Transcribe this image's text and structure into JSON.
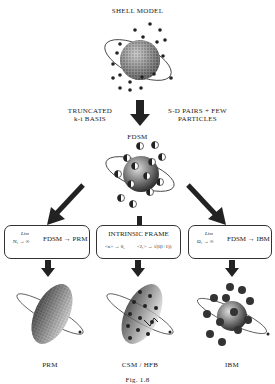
{
  "diagram": {
    "top": {
      "title": "SHELL MODEL"
    },
    "transition": {
      "left_label_line1": "TRUNCATED",
      "left_label_line2": "k-i BASIS",
      "right_label_line1": "S-D PAIRS + FEW",
      "right_label_line2": "PARTICLES"
    },
    "middle": {
      "title": "FDSM"
    },
    "boxes": [
      {
        "lim": "Lim",
        "condition": "N₁ → ∞",
        "result": "FDSM → PRM"
      },
      {
        "title": "INTRINSIC FRAME",
        "formula_left": "<n> → 0,",
        "formula_right": "<J₁> → √(l(l+1))"
      },
      {
        "lim": "Lim",
        "condition": "Ω₁ → ∞",
        "result": "FDSM → IBM"
      }
    ],
    "bottom": [
      {
        "label": "PRM"
      },
      {
        "label": "CSM / HFB"
      },
      {
        "label": "IBM"
      }
    ],
    "caption": "Fig. 1.8"
  }
}
